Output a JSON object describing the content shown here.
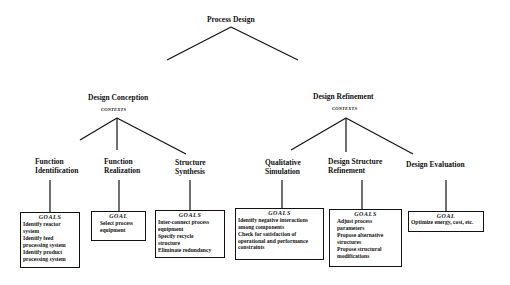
{
  "root": {
    "label": "Process Design"
  },
  "branches": [
    {
      "label": "Design Conception",
      "context_label": "CONTEXTS",
      "children": [
        {
          "label": "Function\nIdentification",
          "goals_header": "GOALS",
          "goals": [
            "Identify reactor\nsystem",
            "Identify feed\nprocessing system",
            "Identify product\nprocessing system"
          ]
        },
        {
          "label": "Function\nRealization",
          "goals_header": "GOAL",
          "goals": [
            "Select process\nequipment"
          ]
        },
        {
          "label": "Structure\nSynthesis",
          "goals_header": "GOALS",
          "goals": [
            "Inter-connect process\nequipment",
            "Specify recycle\nstructure",
            "Eliminate redundancy"
          ]
        }
      ]
    },
    {
      "label": "Design Refinement",
      "context_label": "CONTEXTS",
      "children": [
        {
          "label": "Qualitative\nSimulation",
          "goals_header": "GOALS",
          "goals": [
            "Identify negative interactions\namong components",
            "Check for satisfaction of\noperational and performance\nconstraints"
          ]
        },
        {
          "label": "Design Structure\nRefinement",
          "goals_header": "GOALS",
          "goals": [
            "Adjust process\nparameters",
            "Propose alternative\nstructures",
            "Propose structural\nmodifications"
          ]
        },
        {
          "label": "Design Evaluation",
          "goals_header": "GOAL",
          "goals": [
            "Optimize energy, cost, etc."
          ]
        }
      ]
    }
  ]
}
